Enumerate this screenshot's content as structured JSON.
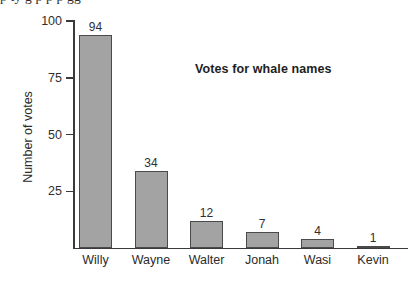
{
  "page": {
    "clipped_top_text": "p  ty g  p       p p               gg"
  },
  "chart_data": {
    "type": "bar",
    "title": "Votes for whale names",
    "xlabel": "",
    "ylabel": "Number of votes",
    "categories": [
      "Willy",
      "Wayne",
      "Walter",
      "Jonah",
      "Wasi",
      "Kevin"
    ],
    "values": [
      94,
      34,
      12,
      7,
      4,
      1
    ],
    "value_labels": [
      "94",
      "34",
      "12",
      "7",
      "4",
      "1"
    ],
    "ylim": [
      0,
      100
    ],
    "yticks": [
      25,
      50,
      75,
      100
    ],
    "ytick_labels": [
      "25",
      "50",
      "75",
      "100"
    ],
    "grid": false,
    "legend": null,
    "colors": {
      "bar_fill": "#a3a3a3",
      "bar_edge": "#4a4a4a",
      "axis": "#3a3a3a",
      "text": "#2b2b2b",
      "background": "#ffffff"
    }
  }
}
